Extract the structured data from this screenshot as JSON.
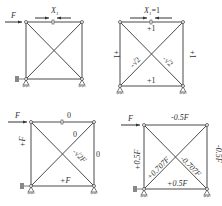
{
  "panels": [
    {
      "id": "a",
      "load_label": "F",
      "redundant_label": "X",
      "redundant_sub": "1",
      "members": {
        "top": "",
        "bottom": "",
        "left": "",
        "right": "",
        "diag1": "",
        "diag2": ""
      }
    },
    {
      "id": "b",
      "redundant_label": "X",
      "redundant_sub": "1",
      "redundant_value": "=1",
      "members": {
        "top": "+1",
        "bottom": "+1",
        "left": "+1",
        "right": "+1",
        "diag1": "-√2",
        "diag2": "-√2"
      }
    },
    {
      "id": "c",
      "load_label": "F",
      "members": {
        "top": "0",
        "bottom": "+F",
        "left": "+F",
        "right": "0",
        "diag1": "0",
        "diag2": "-√2F"
      }
    },
    {
      "id": "d",
      "load_label": "F",
      "members": {
        "top": "-0.5F",
        "bottom": "+0.5F",
        "left": "+0.5F",
        "right": "-0.5F",
        "diag1": "+0.707F",
        "diag2": "-0.707F"
      }
    }
  ]
}
